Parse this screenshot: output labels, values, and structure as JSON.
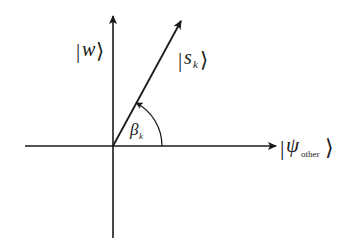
{
  "diagram": {
    "type": "vector-diagram",
    "origin": {
      "x": 113,
      "y": 146
    },
    "axes": {
      "horizontal": {
        "label_symbol": "ψ",
        "label_subscript": "other",
        "label_full": "|ψ_other⟩"
      },
      "vertical": {
        "label_symbol": "w",
        "label_full": "|w⟩"
      }
    },
    "vector": {
      "label_symbol": "s",
      "label_subscript": "k",
      "label_full": "|s_k⟩"
    },
    "angle": {
      "label_symbol": "β",
      "label_subscript": "k",
      "label_full": "β_k"
    },
    "ket_left": "|",
    "ket_right": "⟩",
    "colors": {
      "line": "#1a1a1a",
      "background": "#ffffff"
    }
  }
}
